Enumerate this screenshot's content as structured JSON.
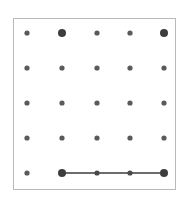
{
  "figure": {
    "title": "",
    "kind": "dot-grid-geoboard",
    "canvas": {
      "width": 188,
      "height": 204
    },
    "frame": {
      "x": 13,
      "y": 18,
      "width": 163,
      "height": 172,
      "border_color": "#b8b8b8",
      "border_width": 1,
      "background_color": "#ffffff"
    }
  },
  "chart_data": {
    "type": "scatter",
    "title": "",
    "xlabel": "",
    "ylabel": "",
    "grid": false,
    "legend": null,
    "xlim": [
      1,
      5
    ],
    "ylim": [
      1,
      5
    ],
    "columns": [
      1,
      2,
      3,
      4,
      5
    ],
    "rows": [
      1,
      2,
      3,
      4,
      5
    ],
    "column_x_px": [
      27,
      62,
      97,
      130,
      164
    ],
    "row_y_px": [
      33,
      68,
      103,
      138,
      173
    ],
    "dot_color": "#5a5a5a",
    "dot_color_emphasis": "#3d3d3d",
    "dot_radius_small": 2.6,
    "dot_radius_large": 4.0,
    "points": [
      {
        "col": 1,
        "row": 1,
        "cx": 27,
        "cy": 33,
        "r": 2.6,
        "color": "#5a5a5a",
        "emphasis": false
      },
      {
        "col": 2,
        "row": 1,
        "cx": 62,
        "cy": 33,
        "r": 4.0,
        "color": "#3d3d3d",
        "emphasis": true
      },
      {
        "col": 3,
        "row": 1,
        "cx": 97,
        "cy": 33,
        "r": 2.6,
        "color": "#5a5a5a",
        "emphasis": false
      },
      {
        "col": 4,
        "row": 1,
        "cx": 130,
        "cy": 33,
        "r": 2.6,
        "color": "#5a5a5a",
        "emphasis": false
      },
      {
        "col": 5,
        "row": 1,
        "cx": 164,
        "cy": 33,
        "r": 4.0,
        "color": "#3d3d3d",
        "emphasis": true
      },
      {
        "col": 1,
        "row": 2,
        "cx": 27,
        "cy": 68,
        "r": 2.6,
        "color": "#5a5a5a",
        "emphasis": false
      },
      {
        "col": 2,
        "row": 2,
        "cx": 62,
        "cy": 68,
        "r": 2.6,
        "color": "#5a5a5a",
        "emphasis": false
      },
      {
        "col": 3,
        "row": 2,
        "cx": 97,
        "cy": 68,
        "r": 2.6,
        "color": "#5a5a5a",
        "emphasis": false
      },
      {
        "col": 4,
        "row": 2,
        "cx": 130,
        "cy": 68,
        "r": 2.6,
        "color": "#5a5a5a",
        "emphasis": false
      },
      {
        "col": 5,
        "row": 2,
        "cx": 164,
        "cy": 68,
        "r": 2.6,
        "color": "#5a5a5a",
        "emphasis": false
      },
      {
        "col": 1,
        "row": 3,
        "cx": 27,
        "cy": 103,
        "r": 2.6,
        "color": "#5a5a5a",
        "emphasis": false
      },
      {
        "col": 2,
        "row": 3,
        "cx": 62,
        "cy": 103,
        "r": 2.6,
        "color": "#5a5a5a",
        "emphasis": false
      },
      {
        "col": 3,
        "row": 3,
        "cx": 97,
        "cy": 103,
        "r": 2.6,
        "color": "#5a5a5a",
        "emphasis": false
      },
      {
        "col": 4,
        "row": 3,
        "cx": 130,
        "cy": 103,
        "r": 2.6,
        "color": "#5a5a5a",
        "emphasis": false
      },
      {
        "col": 5,
        "row": 3,
        "cx": 164,
        "cy": 103,
        "r": 2.6,
        "color": "#5a5a5a",
        "emphasis": false
      },
      {
        "col": 1,
        "row": 4,
        "cx": 27,
        "cy": 138,
        "r": 2.6,
        "color": "#5a5a5a",
        "emphasis": false
      },
      {
        "col": 2,
        "row": 4,
        "cx": 62,
        "cy": 138,
        "r": 2.6,
        "color": "#5a5a5a",
        "emphasis": false
      },
      {
        "col": 3,
        "row": 4,
        "cx": 97,
        "cy": 138,
        "r": 2.6,
        "color": "#5a5a5a",
        "emphasis": false
      },
      {
        "col": 4,
        "row": 4,
        "cx": 130,
        "cy": 138,
        "r": 2.6,
        "color": "#5a5a5a",
        "emphasis": false
      },
      {
        "col": 5,
        "row": 4,
        "cx": 164,
        "cy": 138,
        "r": 2.6,
        "color": "#5a5a5a",
        "emphasis": false
      },
      {
        "col": 1,
        "row": 5,
        "cx": 27,
        "cy": 173,
        "r": 2.6,
        "color": "#5a5a5a",
        "emphasis": false
      },
      {
        "col": 2,
        "row": 5,
        "cx": 62,
        "cy": 173,
        "r": 4.0,
        "color": "#3d3d3d",
        "emphasis": true
      },
      {
        "col": 3,
        "row": 5,
        "cx": 97,
        "cy": 173,
        "r": 2.6,
        "color": "#4a4a4a",
        "emphasis": false
      },
      {
        "col": 4,
        "row": 5,
        "cx": 130,
        "cy": 173,
        "r": 2.6,
        "color": "#4a4a4a",
        "emphasis": false
      },
      {
        "col": 5,
        "row": 5,
        "cx": 164,
        "cy": 173,
        "r": 4.0,
        "color": "#3d3d3d",
        "emphasis": true
      }
    ],
    "segments": [
      {
        "name": "bottom-horizontal-segment",
        "x1": 62,
        "y1": 173,
        "x2": 164,
        "y2": 173,
        "color": "#3d3d3d",
        "width": 1.6,
        "from_col": 2,
        "to_col": 5,
        "row": 5
      }
    ]
  }
}
